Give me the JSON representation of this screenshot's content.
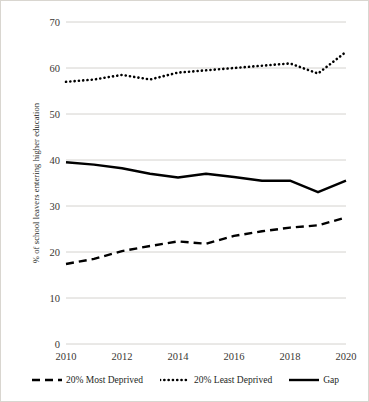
{
  "chart_data": {
    "type": "line",
    "title": "",
    "subtitle": "",
    "xlabel": "",
    "ylabel": "% of school leavers entering higher education",
    "x": [
      2010,
      2011,
      2012,
      2013,
      2014,
      2015,
      2016,
      2017,
      2018,
      2019,
      2020
    ],
    "xtick_labels": [
      "2010",
      "2012",
      "2014",
      "2016",
      "2018",
      "2020"
    ],
    "xticks": [
      2010,
      2012,
      2014,
      2016,
      2018,
      2020
    ],
    "ytick_labels": [
      "0",
      "10",
      "20",
      "30",
      "40",
      "50",
      "60",
      "70"
    ],
    "yticks": [
      0,
      10,
      20,
      30,
      40,
      50,
      60,
      70
    ],
    "xlim": [
      2010,
      2020
    ],
    "ylim": [
      0,
      70
    ],
    "grid": "horizontal",
    "legend_position": "bottom",
    "series": [
      {
        "name": "20% Most Deprived",
        "style": "dashed",
        "color": "#000000",
        "values": [
          17.4,
          18.5,
          20.2,
          21.3,
          22.3,
          21.8,
          23.5,
          24.5,
          25.3,
          25.8,
          27.5
        ]
      },
      {
        "name": "20% Least Deprived",
        "style": "dotted",
        "color": "#000000",
        "values": [
          57.0,
          57.5,
          58.5,
          57.5,
          59.0,
          59.5,
          60.0,
          60.5,
          61.0,
          58.8,
          63.5
        ]
      },
      {
        "name": "Gap",
        "style": "solid",
        "color": "#000000",
        "values": [
          39.5,
          39.0,
          38.2,
          37.0,
          36.2,
          37.0,
          36.3,
          35.5,
          35.5,
          33.0,
          35.5
        ]
      }
    ]
  },
  "axis": {
    "y_title": "% of school leavers entering higher education"
  },
  "legend": {
    "items": [
      {
        "label": "20% Most Deprived",
        "style": "dashed"
      },
      {
        "label": "20% Least Deprived",
        "style": "dotted"
      },
      {
        "label": "Gap",
        "style": "solid"
      }
    ]
  },
  "colors": {
    "line": "#000000",
    "gridline": "#c9c6c1",
    "axis_text": "#3a3734",
    "border": "#d9d6d0",
    "background": "#ffffff"
  }
}
